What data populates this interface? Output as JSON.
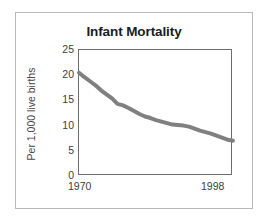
{
  "figure": {
    "background_color": "#ffffff",
    "border_color": "#b9b9b9"
  },
  "chart_data": {
    "type": "line",
    "title": "Infant Mortality",
    "subtitle": "",
    "xlabel": "",
    "ylabel": "Per 1,000 live births",
    "xlim": [
      1970,
      1998
    ],
    "ylim": [
      0,
      25
    ],
    "grid": false,
    "legend": false,
    "legend_position": "none",
    "line_color": "#808080",
    "line_width": 4,
    "y_ticks": [
      25,
      20,
      15,
      10,
      5,
      0
    ],
    "y_tick_labels": [
      "25",
      "20",
      "15",
      "10",
      "5",
      "0"
    ],
    "x_ticks": [
      1970,
      1998
    ],
    "x_tick_labels": [
      "1970",
      "1998"
    ],
    "series": [
      {
        "name": "Infant mortality rate",
        "x": [
          1970,
          1971,
          1972,
          1973,
          1974,
          1975,
          1976,
          1977,
          1978,
          1979,
          1980,
          1981,
          1982,
          1983,
          1984,
          1985,
          1986,
          1987,
          1988,
          1989,
          1990,
          1991,
          1992,
          1993,
          1994,
          1995,
          1996,
          1997,
          1998
        ],
        "values": [
          20.5,
          19.6,
          18.8,
          18.0,
          17.0,
          16.2,
          15.4,
          14.3,
          14.0,
          13.5,
          12.9,
          12.3,
          11.8,
          11.5,
          11.1,
          10.8,
          10.5,
          10.2,
          10.1,
          10.0,
          9.8,
          9.4,
          9.0,
          8.7,
          8.4,
          8.0,
          7.6,
          7.2,
          7.0
        ]
      }
    ]
  }
}
